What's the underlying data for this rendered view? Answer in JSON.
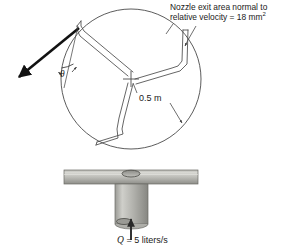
{
  "figure": {
    "views": {
      "plan": "top view of three-arm rotating sprinkler inside swept circle",
      "elevation": "side view of sprinkler arm on vertical supply pipe"
    },
    "annotations": {
      "nozzle_area_line1": "Nozzle exit area normal to",
      "nozzle_area_line2": "relative velocity = 18 mm",
      "nozzle_area_exponent": "2",
      "radius": "0.5 m",
      "angle_symbol": "θ",
      "flow_symbol": "Q",
      "flow_value": "= 5 liters/s"
    },
    "colors": {
      "ink": "#1a1a1a",
      "line": "#3c3c3c",
      "metal_light": "#d6d6d2",
      "metal_mid": "#a9a9a4",
      "metal_dark": "#7e7e79",
      "background": "#ffffff"
    },
    "geometry": {
      "circle_center_x": 131,
      "circle_center_y": 79,
      "circle_radius": 70,
      "arm_count": 3
    }
  }
}
